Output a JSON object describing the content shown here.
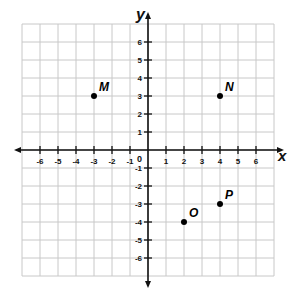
{
  "chart_data": {
    "type": "scatter",
    "title": "",
    "xlabel": "x",
    "ylabel": "y",
    "xlim": [
      -7,
      7
    ],
    "ylim": [
      -7,
      7
    ],
    "grid": true,
    "origin_label": "0",
    "x_ticks": [
      -6,
      -5,
      -4,
      -3,
      -2,
      -1,
      1,
      2,
      3,
      4,
      5,
      6
    ],
    "y_ticks": [
      -6,
      -5,
      -4,
      -3,
      -2,
      -1,
      1,
      2,
      3,
      4,
      5,
      6
    ],
    "points": [
      {
        "label": "M",
        "x": -3,
        "y": 3
      },
      {
        "label": "N",
        "x": 4,
        "y": 3
      },
      {
        "label": "O",
        "x": 2,
        "y": -4
      },
      {
        "label": "P",
        "x": 4,
        "y": -3
      }
    ]
  },
  "layout": {
    "origin_px": [
      148,
      150
    ],
    "cell_px": 18,
    "grid_color": "#c8c8c8",
    "axis_color": "#111111",
    "point_color": "#000000"
  }
}
